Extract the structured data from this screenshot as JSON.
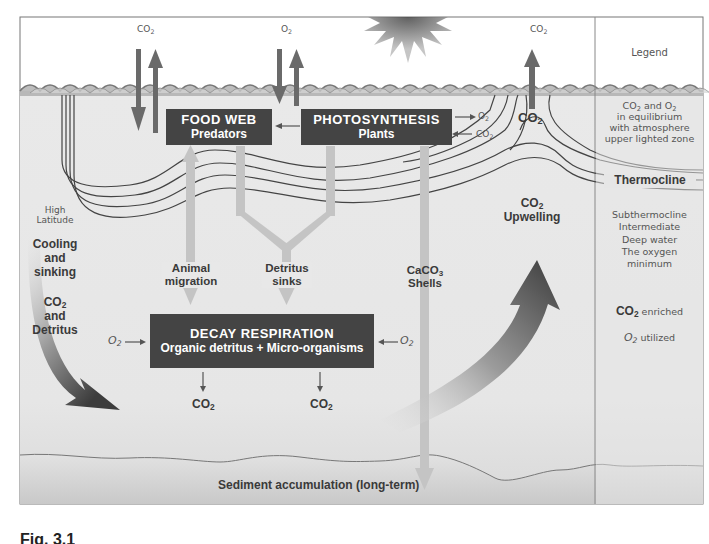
{
  "diagram": {
    "atmosphere": {
      "left_gas_label": "CO2",
      "center_gas_label": "O2",
      "right_gas_label": "CO2"
    },
    "legend": {
      "title": "Legend",
      "zones": [
        {
          "id": "upper",
          "lines": [
            "CO2 and O2",
            "in equilibrium",
            "with atmosphere",
            "upper lighted zone"
          ]
        },
        {
          "id": "thermocline",
          "label": "Thermocline"
        },
        {
          "id": "deep",
          "lines": [
            "Subthermocline",
            "Intermediate",
            "Deep water",
            "The oxygen",
            "minimum"
          ]
        },
        {
          "id": "enriched",
          "strong": "CO2",
          "text": "enriched"
        },
        {
          "id": "utilized",
          "strong": "O2",
          "text": "utilized"
        }
      ]
    },
    "boxes": {
      "food_web": {
        "title": "FOOD WEB",
        "subtitle": "Predators"
      },
      "photosynthesis": {
        "title": "PHOTOSYNTHESIS",
        "subtitle": "Plants"
      },
      "decay": {
        "title": "DECAY RESPIRATION",
        "subtitle": "Organic detritus + Micro-organisms"
      }
    },
    "photosynthesis_outputs": {
      "o2": "O2",
      "co2": "CO2"
    },
    "labels": {
      "high_latitude": [
        "High",
        "Latitude"
      ],
      "cooling": [
        "Cooling",
        "and",
        "sinking"
      ],
      "co2_detritus": [
        "CO2",
        "and",
        "Detritus"
      ],
      "animal_migration": [
        "Animal",
        "migration"
      ],
      "detritus_sinks": [
        "Detritus",
        "sinks"
      ],
      "caco3_shells": [
        "CaCO3",
        "Shells"
      ],
      "upwelling": [
        "CO2",
        "Upwelling"
      ],
      "surface_co2": "CO2",
      "decay_in_left": "O2",
      "decay_in_right": "O2",
      "decay_out_left": "CO2",
      "decay_out_right": "CO2",
      "sediment": "Sediment accumulation (long-term)"
    },
    "caption": "Fig. 3.1"
  },
  "colors": {
    "ocean": "#e8e8e8",
    "sediment": "#d4d4d4",
    "box": "#444444",
    "arrow_dark": "#6a6a6a",
    "arrow_light": "#c4c4c4",
    "line": "#555555"
  }
}
